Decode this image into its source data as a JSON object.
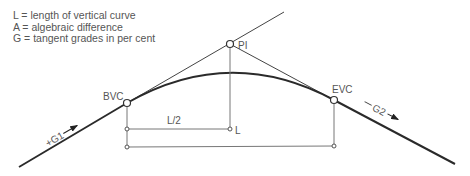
{
  "legend": {
    "items": [
      "L = length of vertical curve",
      "A = algebraic difference",
      "G = tangent grades in per cent"
    ]
  },
  "diagram": {
    "points": {
      "pi": "PI",
      "bvc": "BVC",
      "evc": "EVC"
    },
    "labels": {
      "half_length": "L/2",
      "length": "L",
      "grade1": "+G1",
      "grade2": "G2"
    },
    "colors": {
      "line": "#2a2a2a",
      "thin_line": "#777777",
      "text": "#555555"
    }
  }
}
